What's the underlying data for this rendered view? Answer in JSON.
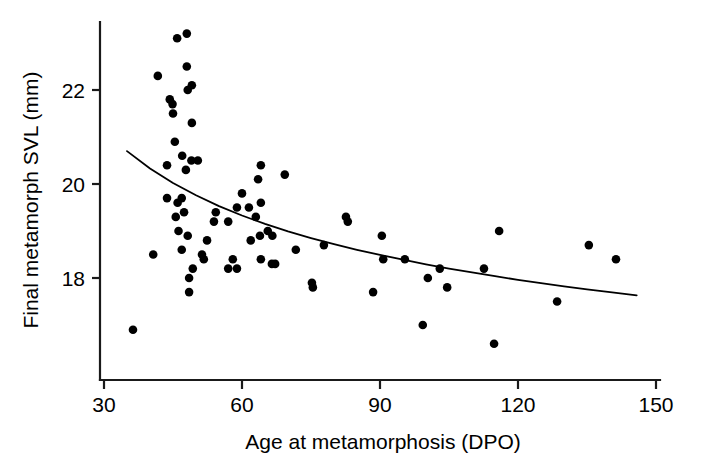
{
  "chart_data": {
    "type": "scatter",
    "title": "",
    "xlabel": "Age at metamorphosis (DPO)",
    "ylabel": "Final metamorph SVL (mm)",
    "xlim": [
      30,
      150
    ],
    "ylim": [
      16.3,
      23.6
    ],
    "xticks": [
      30,
      60,
      90,
      120,
      150
    ],
    "xtick_labels": [
      "30",
      "60",
      "90",
      "120",
      "150"
    ],
    "yticks": [
      18,
      20,
      22
    ],
    "ytick_labels": [
      "18",
      "22",
      "20"
    ],
    "grid": false,
    "legend": "none",
    "marker": "filled-circle",
    "marker_color": "#000000",
    "points": [
      {
        "x": 45.9,
        "y": 23.1
      },
      {
        "x": 48.0,
        "y": 23.2
      },
      {
        "x": 48.0,
        "y": 22.5
      },
      {
        "x": 41.7,
        "y": 22.3
      },
      {
        "x": 44.3,
        "y": 21.8
      },
      {
        "x": 44.9,
        "y": 21.7
      },
      {
        "x": 48.2,
        "y": 22.0
      },
      {
        "x": 49.1,
        "y": 22.1
      },
      {
        "x": 45.0,
        "y": 21.5
      },
      {
        "x": 49.1,
        "y": 21.3
      },
      {
        "x": 45.4,
        "y": 20.9
      },
      {
        "x": 43.7,
        "y": 20.4
      },
      {
        "x": 47.0,
        "y": 20.6
      },
      {
        "x": 49.0,
        "y": 20.5
      },
      {
        "x": 50.4,
        "y": 20.5
      },
      {
        "x": 47.8,
        "y": 20.3
      },
      {
        "x": 43.7,
        "y": 19.7
      },
      {
        "x": 46.9,
        "y": 19.7
      },
      {
        "x": 46.0,
        "y": 19.6
      },
      {
        "x": 45.6,
        "y": 19.3
      },
      {
        "x": 47.4,
        "y": 19.4
      },
      {
        "x": 46.2,
        "y": 19.0
      },
      {
        "x": 48.2,
        "y": 18.9
      },
      {
        "x": 54.3,
        "y": 19.4
      },
      {
        "x": 53.9,
        "y": 19.2
      },
      {
        "x": 57.0,
        "y": 19.2
      },
      {
        "x": 52.4,
        "y": 18.8
      },
      {
        "x": 60.0,
        "y": 19.8
      },
      {
        "x": 58.9,
        "y": 19.5
      },
      {
        "x": 61.5,
        "y": 19.5
      },
      {
        "x": 61.9,
        "y": 18.8
      },
      {
        "x": 46.9,
        "y": 18.6
      },
      {
        "x": 51.3,
        "y": 18.5
      },
      {
        "x": 51.7,
        "y": 18.4
      },
      {
        "x": 58.0,
        "y": 18.4
      },
      {
        "x": 40.7,
        "y": 18.5
      },
      {
        "x": 49.3,
        "y": 18.2
      },
      {
        "x": 57.0,
        "y": 18.2
      },
      {
        "x": 58.9,
        "y": 18.2
      },
      {
        "x": 48.5,
        "y": 18.0
      },
      {
        "x": 48.5,
        "y": 17.7
      },
      {
        "x": 36.3,
        "y": 16.9
      },
      {
        "x": 64.1,
        "y": 20.4
      },
      {
        "x": 69.3,
        "y": 20.2
      },
      {
        "x": 63.5,
        "y": 20.1
      },
      {
        "x": 64.1,
        "y": 19.6
      },
      {
        "x": 63.0,
        "y": 19.3
      },
      {
        "x": 65.6,
        "y": 19.0
      },
      {
        "x": 63.9,
        "y": 18.9
      },
      {
        "x": 66.6,
        "y": 18.9
      },
      {
        "x": 82.6,
        "y": 19.3
      },
      {
        "x": 83.0,
        "y": 19.2
      },
      {
        "x": 77.8,
        "y": 18.7
      },
      {
        "x": 71.7,
        "y": 18.6
      },
      {
        "x": 64.1,
        "y": 18.4
      },
      {
        "x": 66.5,
        "y": 18.3
      },
      {
        "x": 67.2,
        "y": 18.3
      },
      {
        "x": 75.2,
        "y": 17.9
      },
      {
        "x": 75.4,
        "y": 17.8
      },
      {
        "x": 88.5,
        "y": 17.7
      },
      {
        "x": 90.4,
        "y": 18.9
      },
      {
        "x": 90.7,
        "y": 18.4
      },
      {
        "x": 95.4,
        "y": 18.4
      },
      {
        "x": 103.0,
        "y": 18.2
      },
      {
        "x": 100.4,
        "y": 18.0
      },
      {
        "x": 104.6,
        "y": 17.8
      },
      {
        "x": 112.6,
        "y": 18.2
      },
      {
        "x": 115.9,
        "y": 19.0
      },
      {
        "x": 99.3,
        "y": 17.0
      },
      {
        "x": 114.8,
        "y": 16.6
      },
      {
        "x": 135.4,
        "y": 18.7
      },
      {
        "x": 141.3,
        "y": 18.4
      },
      {
        "x": 128.5,
        "y": 17.5
      }
    ],
    "fit_curve": {
      "description": "decreasing power/exponential fit line",
      "x_start": 35.0,
      "x_end": 145.8,
      "y_start": 20.7,
      "y_end": 17.3,
      "points": [
        {
          "x": 35.0,
          "y": 20.7
        },
        {
          "x": 40.0,
          "y": 20.33
        },
        {
          "x": 45.0,
          "y": 20.02
        },
        {
          "x": 50.0,
          "y": 19.76
        },
        {
          "x": 55.0,
          "y": 19.53
        },
        {
          "x": 60.0,
          "y": 19.33
        },
        {
          "x": 65.0,
          "y": 19.15
        },
        {
          "x": 70.0,
          "y": 18.99
        },
        {
          "x": 75.0,
          "y": 18.85
        },
        {
          "x": 80.0,
          "y": 18.72
        },
        {
          "x": 85.0,
          "y": 18.6
        },
        {
          "x": 90.0,
          "y": 18.49
        },
        {
          "x": 95.0,
          "y": 18.39
        },
        {
          "x": 100.0,
          "y": 18.29
        },
        {
          "x": 105.0,
          "y": 18.2
        },
        {
          "x": 110.0,
          "y": 18.12
        },
        {
          "x": 115.0,
          "y": 18.04
        },
        {
          "x": 120.0,
          "y": 17.96
        },
        {
          "x": 125.0,
          "y": 17.89
        },
        {
          "x": 130.0,
          "y": 17.82
        },
        {
          "x": 135.0,
          "y": 17.76
        },
        {
          "x": 140.0,
          "y": 17.7
        },
        {
          "x": 145.8,
          "y": 17.63
        }
      ]
    }
  },
  "axes": {
    "x_axis_label": "Age at metamorphosis (DPO)",
    "y_axis_label": "Final metamorph SVL (mm)",
    "x_ticks": [
      "30",
      "60",
      "90",
      "120",
      "150"
    ],
    "y_ticks": [
      "18",
      "20",
      "22"
    ]
  }
}
